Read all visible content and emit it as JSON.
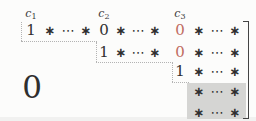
{
  "figure": {
    "description_label": "row-echelon-form-matrix-schematic",
    "zero_block_label": "0",
    "column_labels": [
      {
        "base": "c",
        "sub": "1",
        "col": 0
      },
      {
        "base": "c",
        "sub": "2",
        "col": 4
      },
      {
        "base": "c",
        "sub": "3",
        "col": 8
      }
    ],
    "matrix": {
      "rows": [
        {
          "cells": [
            {
              "t": "1",
              "col": 0,
              "kind": "num"
            },
            {
              "t": "∗",
              "col": 1,
              "kind": "star"
            },
            {
              "t": "⋯",
              "col": 2,
              "kind": "dots"
            },
            {
              "t": "∗",
              "col": 3,
              "kind": "star"
            },
            {
              "t": "0",
              "col": 4,
              "kind": "num"
            },
            {
              "t": "∗",
              "col": 5,
              "kind": "star"
            },
            {
              "t": "⋯",
              "col": 6,
              "kind": "dots"
            },
            {
              "t": "∗",
              "col": 7,
              "kind": "star"
            },
            {
              "t": "0",
              "col": 8,
              "kind": "num",
              "accent": true
            },
            {
              "t": "∗",
              "col": 9,
              "kind": "star"
            },
            {
              "t": "⋯",
              "col": 10,
              "kind": "dots"
            },
            {
              "t": "∗",
              "col": 11,
              "kind": "star"
            }
          ]
        },
        {
          "cells": [
            {
              "t": "1",
              "col": 4,
              "kind": "num"
            },
            {
              "t": "∗",
              "col": 5,
              "kind": "star"
            },
            {
              "t": "⋯",
              "col": 6,
              "kind": "dots"
            },
            {
              "t": "∗",
              "col": 7,
              "kind": "star"
            },
            {
              "t": "0",
              "col": 8,
              "kind": "num",
              "accent": true
            },
            {
              "t": "∗",
              "col": 9,
              "kind": "star"
            },
            {
              "t": "⋯",
              "col": 10,
              "kind": "dots"
            },
            {
              "t": "∗",
              "col": 11,
              "kind": "star"
            }
          ]
        },
        {
          "cells": [
            {
              "t": "1",
              "col": 8,
              "kind": "num"
            },
            {
              "t": "∗",
              "col": 9,
              "kind": "star"
            },
            {
              "t": "⋯",
              "col": 10,
              "kind": "dots"
            },
            {
              "t": "∗",
              "col": 11,
              "kind": "star"
            }
          ]
        },
        {
          "cells": [
            {
              "t": "∗",
              "col": 9,
              "kind": "star"
            },
            {
              "t": "⋯",
              "col": 10,
              "kind": "dots"
            },
            {
              "t": "∗",
              "col": 11,
              "kind": "star"
            }
          ]
        },
        {
          "cells": [
            {
              "t": "∗",
              "col": 9,
              "kind": "star"
            },
            {
              "t": "⋯",
              "col": 10,
              "kind": "dots"
            },
            {
              "t": "∗",
              "col": 11,
              "kind": "star"
            }
          ]
        }
      ]
    },
    "colors": {
      "ink": "#2f2f2f",
      "accent": "#bf6b61",
      "shade": "#d5d5d3",
      "dotted": "#b3b3b3",
      "bracket": "#444444",
      "background": "#fcfcfb"
    }
  }
}
